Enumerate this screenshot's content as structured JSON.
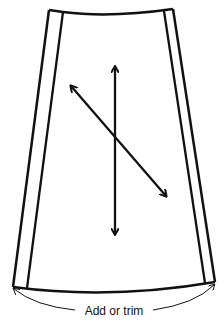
{
  "diagram": {
    "bottom_label": "Add or trim",
    "colors": {
      "line": "#111111",
      "background": "#ffffff"
    },
    "elements": {
      "outer_panel": "trapezoid-outline",
      "left_seam_allowance": "inner-left-line",
      "right_seam_allowance": "inner-right-line",
      "vertical_grainline": "double-headed-arrow-vertical",
      "diagonal_bias_line": "double-headed-arrow-diagonal",
      "hem_measure_arc": "curved-arrow-add-or-trim"
    }
  }
}
